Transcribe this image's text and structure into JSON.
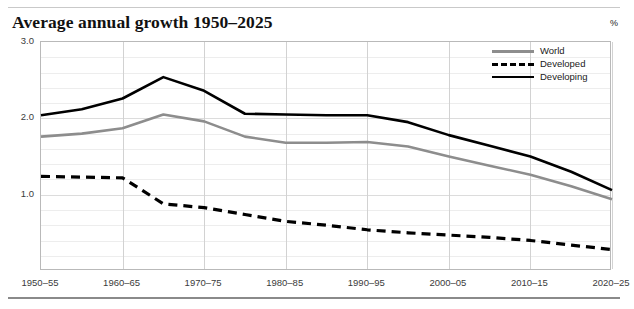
{
  "header": {
    "title": "Average annual growth 1950–2025",
    "unit_label": "%"
  },
  "legend": {
    "position": "top-right",
    "items": [
      {
        "label": "World",
        "color": "#8d8d8d",
        "style": "solid"
      },
      {
        "label": "Developed",
        "color": "#000000",
        "style": "dashed"
      },
      {
        "label": "Developing",
        "color": "#000000",
        "style": "solid"
      }
    ]
  },
  "axes": {
    "y_ticks": [
      "3.0",
      "2.0",
      "1.0"
    ],
    "x_ticks": [
      "1950–55",
      "1960–65",
      "1970–75",
      "1980–85",
      "1990–95",
      "2000–05",
      "2010–15",
      "2020–25"
    ]
  },
  "chart_data": {
    "type": "line",
    "title": "Average annual growth 1950–2025",
    "xlabel": "",
    "ylabel": "%",
    "ylim": [
      0,
      3.0
    ],
    "y_major_ticks": [
      1.0,
      2.0,
      3.0
    ],
    "y_minor_step": 0.2,
    "grid": true,
    "legend_position": "top-right",
    "x_tick_labels": [
      "1950–55",
      "1960–65",
      "1970–75",
      "1980–85",
      "1990–95",
      "2000–05",
      "2010–15",
      "2020–25"
    ],
    "categories": [
      "1950–55",
      "1955–60",
      "1960–65",
      "1965–70",
      "1970–75",
      "1975–80",
      "1980–85",
      "1985–90",
      "1990–95",
      "1995–2000",
      "2000–05",
      "2005–10",
      "2010–15",
      "2015–20",
      "2020–25"
    ],
    "series": [
      {
        "name": "World",
        "color": "#8d8d8d",
        "style": "solid",
        "values": [
          1.76,
          1.8,
          1.87,
          2.05,
          1.96,
          1.76,
          1.68,
          1.68,
          1.69,
          1.63,
          1.5,
          1.38,
          1.26,
          1.11,
          0.94
        ]
      },
      {
        "name": "Developed",
        "color": "#000000",
        "style": "dashed",
        "values": [
          1.24,
          1.23,
          1.22,
          0.88,
          0.83,
          0.74,
          0.65,
          0.6,
          0.54,
          0.5,
          0.47,
          0.44,
          0.4,
          0.34,
          0.28
        ]
      },
      {
        "name": "Developing",
        "color": "#000000",
        "style": "solid",
        "values": [
          2.04,
          2.12,
          2.26,
          2.54,
          2.36,
          2.06,
          2.05,
          2.04,
          2.04,
          1.95,
          1.78,
          1.64,
          1.5,
          1.3,
          1.06
        ]
      }
    ]
  }
}
